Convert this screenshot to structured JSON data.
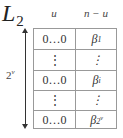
{
  "title": {
    "base": "L",
    "subscript": "2"
  },
  "columns": [
    {
      "label": "u"
    },
    {
      "label": "n − u"
    }
  ],
  "arrow_label": {
    "base": "2",
    "superscript": "v"
  },
  "rows": [
    {
      "left": "0…0",
      "right_base": "β",
      "right_sub": "1",
      "right_sup": ""
    },
    {
      "left": "⋮",
      "right_base": "⋮",
      "right_sub": "",
      "right_sup": ""
    },
    {
      "left": "0…0",
      "right_base": "β",
      "right_sub": "i",
      "right_sup": ""
    },
    {
      "left": "⋮",
      "right_base": "⋮",
      "right_sub": "",
      "right_sup": ""
    },
    {
      "left": "0…0",
      "right_base": "β",
      "right_sub": "2",
      "right_sup": "v"
    }
  ],
  "colors": {
    "grid": "#999999",
    "text": "#222222"
  }
}
